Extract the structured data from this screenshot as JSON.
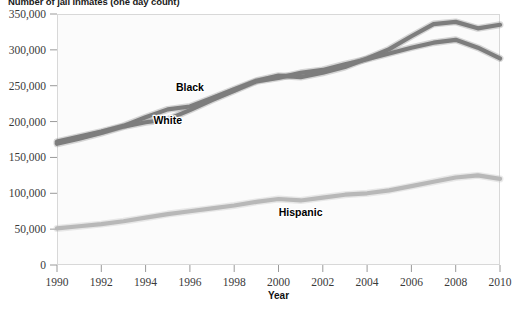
{
  "chart_data": {
    "type": "line",
    "title": "Number of jail inmates (one day count)",
    "xlabel": "Year",
    "ylabel": "",
    "xlim": [
      1990,
      2010
    ],
    "ylim": [
      0,
      350000
    ],
    "grid": false,
    "legend_position": "inline-labels",
    "x": [
      1990,
      1991,
      1992,
      1993,
      1994,
      1995,
      1996,
      1997,
      1998,
      1999,
      2000,
      2001,
      2002,
      2003,
      2004,
      2005,
      2006,
      2007,
      2008,
      2009,
      2010
    ],
    "xticks": [
      "1990",
      "1992",
      "1994",
      "1996",
      "1998",
      "2000",
      "2002",
      "2004",
      "2006",
      "2008",
      "2010"
    ],
    "xtick_values": [
      1990,
      1992,
      1994,
      1996,
      1998,
      2000,
      2002,
      2004,
      2006,
      2008,
      2010
    ],
    "yticks": [
      "0",
      "50,000",
      "100,000",
      "150,000",
      "200,000",
      "250,000",
      "300,000",
      "350,000"
    ],
    "ytick_values": [
      0,
      50000,
      100000,
      150000,
      200000,
      250000,
      300000,
      350000
    ],
    "series": [
      {
        "name": "Black",
        "color": "#7d7d7d",
        "label_x": 1996,
        "label_y": 243000,
        "values": [
          172000,
          179000,
          186000,
          194000,
          206000,
          217000,
          221000,
          233000,
          245000,
          257000,
          264000,
          262000,
          268000,
          276000,
          288000,
          301000,
          319000,
          336000,
          339000,
          330000,
          335000
        ]
      },
      {
        "name": "White",
        "color": "#7d7d7d",
        "label_x": 1995,
        "label_y": 196000,
        "values": [
          169000,
          176000,
          184000,
          193000,
          199000,
          203000,
          216000,
          230000,
          243000,
          256000,
          261000,
          268000,
          272000,
          280000,
          287000,
          295000,
          303000,
          310000,
          314000,
          303000,
          288000
        ]
      },
      {
        "name": "Hispanic",
        "color": "#b8b8b8",
        "label_x": 2001,
        "label_y": 68000,
        "values": [
          51000,
          54000,
          57000,
          61000,
          66000,
          71000,
          75000,
          79000,
          83000,
          88000,
          92000,
          90000,
          94000,
          98000,
          100000,
          104000,
          110000,
          116000,
          122000,
          125000,
          120000
        ]
      }
    ]
  }
}
